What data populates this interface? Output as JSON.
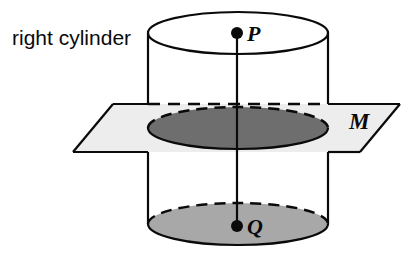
{
  "figure": {
    "caption": "right cylinder",
    "labels": {
      "top_point": "P",
      "bottom_point": "Q",
      "plane": "M"
    },
    "colors": {
      "outline": "#0a0a0a",
      "plane_fill": "#ededed",
      "cross_section_fill": "#6e6e6e",
      "base_fill": "#a8a8a8",
      "top_fill": "#ffffff",
      "background": "#ffffff"
    },
    "geometry": {
      "cylinder": {
        "left_wall_x": 148,
        "right_wall_x": 328,
        "top_ellipse_center_y": 33,
        "bottom_ellipse_center_y": 224,
        "ellipse_rx": 90,
        "ellipse_ry": 21
      },
      "axis": {
        "x": 237,
        "top_y": 33,
        "bottom_y": 224
      },
      "plane_vertices": "113,104 400,104 360,152 73,152",
      "cross_section_center_y": 128
    }
  }
}
